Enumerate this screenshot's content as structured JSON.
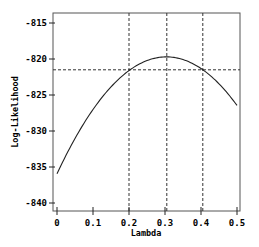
{
  "chart_data": {
    "type": "line",
    "title": "",
    "xlabel": "Lambda",
    "ylabel": "Log-Likelihood",
    "xlim": [
      0,
      0.5
    ],
    "ylim": [
      -841,
      -813.5
    ],
    "grid": false,
    "legend": null,
    "x_ticks": [
      0,
      0.1,
      0.2,
      0.3,
      0.4,
      0.5
    ],
    "x_tick_labels": [
      "0",
      "0.1",
      "0.2",
      "0.3",
      "0.4",
      "0.5"
    ],
    "y_ticks": [
      -815,
      -820,
      -825,
      -830,
      -835,
      -840
    ],
    "y_tick_labels": [
      "-815",
      "-820",
      "-825",
      "-830",
      "-835",
      "-840"
    ],
    "series": [
      {
        "name": "profile log-likelihood",
        "color": "#000000",
        "style": "solid",
        "x": [
          0,
          0.05,
          0.1,
          0.15,
          0.2,
          0.25,
          0.3,
          0.35,
          0.4,
          0.45,
          0.5
        ],
        "values": [
          -835.8,
          -831.0,
          -827.2,
          -824.1,
          -821.6,
          -820.1,
          -819.6,
          -820.0,
          -821.3,
          -823.5,
          -826.5
        ]
      }
    ],
    "annotations": {
      "hline": {
        "y": -821.5,
        "style": "dashed",
        "label": "max - cutoff"
      },
      "vlines": [
        {
          "x": 0.2,
          "style": "dashed",
          "label": "lower CI"
        },
        {
          "x": 0.305,
          "style": "dashed",
          "label": "MLE"
        },
        {
          "x": 0.405,
          "style": "dashed",
          "label": "upper CI"
        }
      ]
    }
  }
}
